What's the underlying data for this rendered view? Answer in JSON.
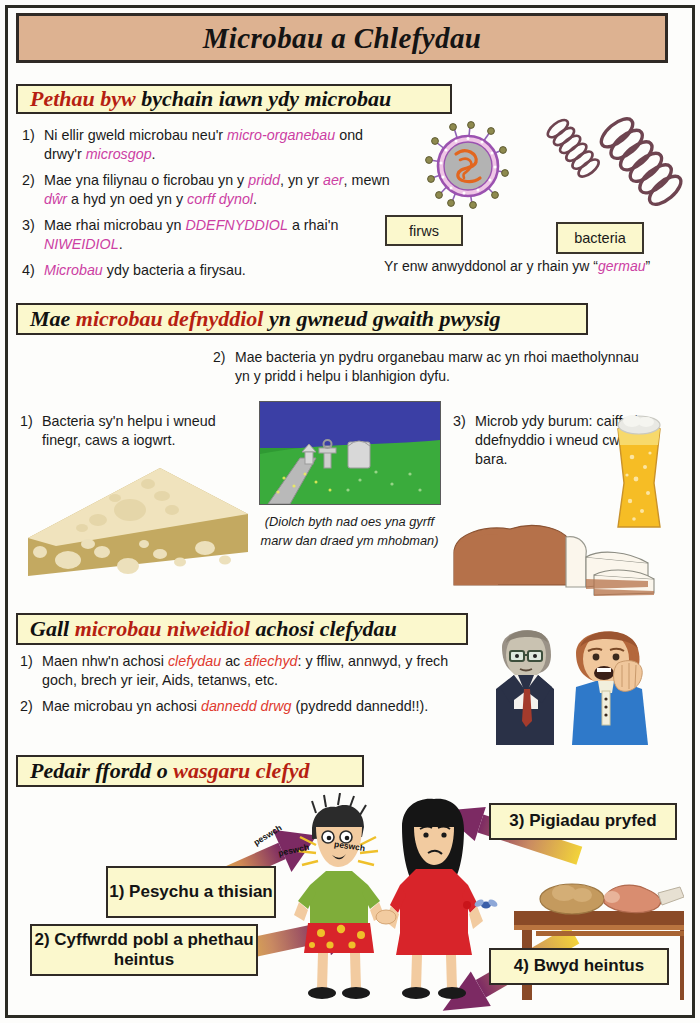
{
  "title": "Microbau a Chlefydau",
  "sections": [
    {
      "id": "s1",
      "header": {
        "pre": "Pethau byw",
        "post": " bychain iawn ydy microbau"
      },
      "items": [
        {
          "n": "1)",
          "parts": [
            {
              "t": "Ni ellir gweld microbau neu'r ",
              "s": "n"
            },
            {
              "t": "micro-organebau",
              "s": "m"
            },
            {
              "t": " ond drwy'r ",
              "s": "n"
            },
            {
              "t": "microsgop",
              "s": "m"
            },
            {
              "t": ".",
              "s": "n"
            }
          ]
        },
        {
          "n": "2)",
          "parts": [
            {
              "t": "Mae yna filiynau o ficrobau yn y ",
              "s": "n"
            },
            {
              "t": "pridd",
              "s": "m"
            },
            {
              "t": ", yn yr ",
              "s": "n"
            },
            {
              "t": "aer",
              "s": "m"
            },
            {
              "t": ", mewn ",
              "s": "n"
            },
            {
              "t": "dŵr",
              "s": "m"
            },
            {
              "t": " a hyd yn oed yn y ",
              "s": "n"
            },
            {
              "t": "corff dynol",
              "s": "m"
            },
            {
              "t": ".",
              "s": "n"
            }
          ]
        },
        {
          "n": "3)",
          "parts": [
            {
              "t": "Mae rhai microbau yn ",
              "s": "n"
            },
            {
              "t": "DDEFNYDDIOL",
              "s": "m"
            },
            {
              "t": " a rhai'n ",
              "s": "n"
            },
            {
              "t": "NIWEIDIOL",
              "s": "m"
            },
            {
              "t": ".",
              "s": "n"
            }
          ]
        },
        {
          "n": "4)",
          "parts": [
            {
              "t": "Microbau",
              "s": "m"
            },
            {
              "t": " ydy bacteria a firysau.",
              "s": "n"
            }
          ]
        }
      ],
      "labels": {
        "virus": "firws",
        "bacteria": "bacteria"
      },
      "germ_note": {
        "pre": "Yr enw anwyddonol ar y rhain yw “",
        "em": "germau",
        "post": "”"
      }
    },
    {
      "id": "s2",
      "header": {
        "pre": "Mae ",
        "hl": "microbau defnyddiol",
        "post": " yn gwneud gwaith pwysig"
      },
      "item_top": {
        "n": "2)",
        "text": "Mae bacteria yn pydru organebau marw ac yn rhoi maetholynnau yn y pridd i helpu i blanhigion dyfu."
      },
      "item_left": {
        "n": "1)",
        "text": "Bacteria sy'n helpu i wneud finegr, caws a iogwrt."
      },
      "item_right": {
        "n": "3)",
        "text": "Microb ydy burum: caiff ei ddefnyddio i wneud cwrw a bara."
      },
      "caption_line1": "(Diolch byth nad oes yna gyrff",
      "caption_line2": "marw dan draed ym mhobman)"
    },
    {
      "id": "s3",
      "header": {
        "pre": "Gall ",
        "hl": "microbau niweidiol",
        "post": " achosi clefydau"
      },
      "items": [
        {
          "n": "1)",
          "parts": [
            {
              "t": "Maen nhw'n achosi ",
              "s": "n"
            },
            {
              "t": "clefydau",
              "s": "r"
            },
            {
              "t": " ac ",
              "s": "n"
            },
            {
              "t": "afiechyd",
              "s": "r"
            },
            {
              "t": ": y ffliw, annwyd, y frech goch, brech yr ieir, Aids, tetanws, etc.",
              "s": "n"
            }
          ]
        },
        {
          "n": "2)",
          "parts": [
            {
              "t": "Mae microbau yn achosi ",
              "s": "n"
            },
            {
              "t": "dannedd drwg",
              "s": "r"
            },
            {
              "t": " (pydredd dannedd!!).",
              "s": "n"
            }
          ]
        }
      ]
    },
    {
      "id": "s4",
      "header": {
        "pre": "Pedair ffordd o ",
        "hl": "wasgaru clefyd",
        "post": ""
      },
      "boxes": [
        {
          "id": "sb1",
          "label": "1) Pesychu a thisian"
        },
        {
          "id": "sb2",
          "label": "2) Cyffwrdd pobl a phethau heintus"
        },
        {
          "id": "sb3",
          "label": "3) Pigiadau pryfed"
        },
        {
          "id": "sb4",
          "label": "4) Bwyd heintus"
        }
      ],
      "cough_words": [
        "peswch",
        "peswch",
        "peswch"
      ]
    }
  ],
  "colors": {
    "title_banner": "#ddb291",
    "header_box": "#fbf8cd",
    "border_dark": "#2f2a25",
    "highlight_magenta": "#cc3fa3",
    "highlight_red": "#e03a2f",
    "header_accent_red": "#b61f12",
    "arrow_yellow": "#f2d33a",
    "arrow_purple": "#7c2a63"
  }
}
